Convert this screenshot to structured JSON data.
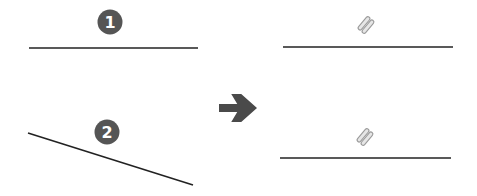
{
  "diagram": {
    "colors": {
      "line": "#222222",
      "badge": "#555555",
      "badge_text": "#ffffff",
      "arrow": "#4a4a4a",
      "constraint_icon": "#9a9a9a"
    },
    "before": {
      "lines": [
        {
          "id": "line-1",
          "badge": "1",
          "x1": 29,
          "y1": 48,
          "x2": 198,
          "y2": 48,
          "badge_cx": 110,
          "badge_cy": 22
        },
        {
          "id": "line-2",
          "badge": "2",
          "x1": 28,
          "y1": 133,
          "x2": 193,
          "y2": 185,
          "badge_cx": 107,
          "badge_cy": 132
        }
      ]
    },
    "arrow": {
      "icon": "arrow-right-icon",
      "x": 219,
      "y": 94,
      "width": 38,
      "height": 28
    },
    "after": {
      "lines": [
        {
          "id": "line-1-constrained",
          "constraint_icon": "horizontal-constraint-icon",
          "x1": 283,
          "y1": 47,
          "x2": 453,
          "y2": 47,
          "icon_cx": 366,
          "icon_cy": 25
        },
        {
          "id": "line-2-constrained",
          "constraint_icon": "horizontal-constraint-icon",
          "x1": 280,
          "y1": 158,
          "x2": 451,
          "y2": 158,
          "icon_cx": 365,
          "icon_cy": 137
        }
      ]
    }
  }
}
